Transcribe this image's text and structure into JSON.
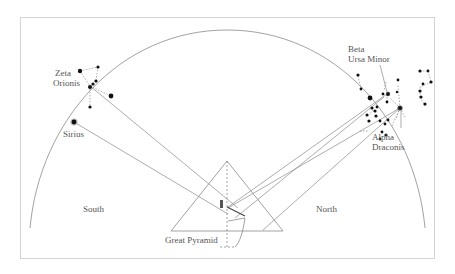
{
  "diagram": {
    "labels": {
      "zeta_orionis_line1": "Zeta",
      "zeta_orionis_line2": "Orionis",
      "sirius": "Sirius",
      "beta_ursa_minor_line1": "Beta",
      "beta_ursa_minor_line2": "Ursa Minor",
      "alpha_draconis_line1": "Alpha",
      "alpha_draconis_line2": "Draconis",
      "south": "South",
      "north": "North",
      "great_pyramid": "Great Pyramid"
    },
    "colors": {
      "line": "#8a8a8a",
      "star": "#111111",
      "text": "#555555",
      "frame": "#cccccc"
    }
  }
}
